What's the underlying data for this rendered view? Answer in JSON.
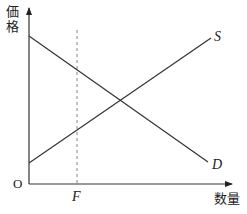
{
  "diagram": {
    "type": "supply-demand",
    "axes": {
      "y_label": "価格",
      "y_label_chars": [
        "価",
        "格"
      ],
      "x_label": "数量",
      "origin_label": "O"
    },
    "curves": [
      {
        "name": "S",
        "label": "S",
        "description": "upward sloping supply curve"
      },
      {
        "name": "D",
        "label": "D",
        "description": "downward sloping demand curve"
      }
    ],
    "markers": [
      {
        "name": "F",
        "label": "F",
        "style": "dashed vertical line"
      }
    ],
    "colors": {
      "line": "#333333",
      "axis": "#333333",
      "dashed": "#777777",
      "background": "#ffffff"
    }
  }
}
